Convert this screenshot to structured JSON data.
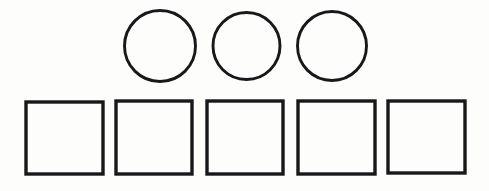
{
  "page": {
    "background_color": "#fdfdfc",
    "stroke_color": "#18181a",
    "width": 489,
    "height": 191
  },
  "figure": {
    "name": "shapes-figure",
    "rows": [
      {
        "name": "circles-row",
        "shape_type": "circle",
        "count": 3,
        "label": "Circles",
        "stroke_width": 2.9,
        "items": [
          {
            "name": "circle-1",
            "cx": 160,
            "cy": 46,
            "r": 35.5
          },
          {
            "name": "circle-2",
            "cx": 246.5,
            "cy": 46,
            "r": 33.5
          },
          {
            "name": "circle-3",
            "cx": 332,
            "cy": 46,
            "r": 34.5
          }
        ]
      },
      {
        "name": "squares-row",
        "shape_type": "square",
        "count": 5,
        "label": "Squares",
        "stroke_width": 3.4,
        "items": [
          {
            "name": "square-1",
            "x": 26,
            "y": 102,
            "width": 77,
            "height": 72
          },
          {
            "name": "square-2",
            "x": 116,
            "y": 101,
            "width": 76,
            "height": 73
          },
          {
            "name": "square-3",
            "x": 207,
            "y": 101,
            "width": 76,
            "height": 73
          },
          {
            "name": "square-4",
            "x": 298,
            "y": 101,
            "width": 77,
            "height": 73
          },
          {
            "name": "square-5",
            "x": 388,
            "y": 101,
            "width": 77,
            "height": 72
          }
        ]
      }
    ]
  }
}
